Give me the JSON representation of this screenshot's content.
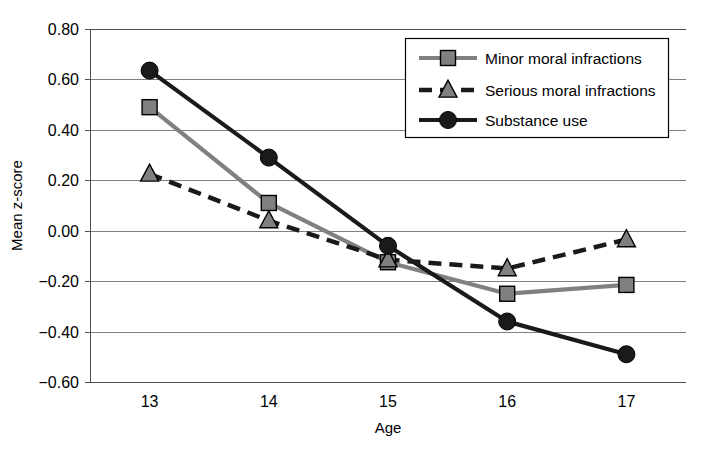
{
  "chart_data": {
    "type": "line",
    "title": "",
    "xlabel": "Age",
    "ylabel": "Mean z-score",
    "categories": [
      "13",
      "14",
      "15",
      "16",
      "17"
    ],
    "x": [
      13,
      14,
      15,
      16,
      17
    ],
    "xlim": [
      12.5,
      17.5
    ],
    "ylim": [
      -0.6,
      0.8
    ],
    "ytick_labels": [
      "0.80",
      "0.60",
      "0.40",
      "0.20",
      "0.00",
      "-0.20",
      "-0.40",
      "-0.60"
    ],
    "ytick_values": [
      0.8,
      0.6,
      0.4,
      0.2,
      0.0,
      -0.2,
      -0.4,
      -0.6
    ],
    "grid": true,
    "grid_axis": "y",
    "legend_position": "top-right",
    "series": [
      {
        "name": "Minor moral infractions",
        "values": [
          0.49,
          0.11,
          -0.125,
          -0.25,
          -0.215
        ],
        "color": "#808080",
        "marker": "square",
        "line_style": "solid"
      },
      {
        "name": "Serious moral infractions",
        "values": [
          0.225,
          0.04,
          -0.115,
          -0.15,
          -0.035
        ],
        "color": "#1a1a1a",
        "marker": "triangle",
        "line_style": "dashed"
      },
      {
        "name": "Substance use",
        "values": [
          0.635,
          0.29,
          -0.06,
          -0.36,
          -0.49
        ],
        "color": "#1a1a1a",
        "marker": "circle",
        "line_style": "solid"
      }
    ]
  },
  "axes": {
    "x_title": "Age",
    "y_title": "Mean z-score"
  },
  "legend": {
    "items": [
      {
        "label": "Minor moral infractions"
      },
      {
        "label": "Serious moral infractions"
      },
      {
        "label": "Substance use"
      }
    ]
  },
  "colors": {
    "gray_series": "#808080",
    "black_series": "#1a1a1a",
    "grid": "#808080",
    "axis": "#4d4d4d",
    "background": "#ffffff"
  }
}
